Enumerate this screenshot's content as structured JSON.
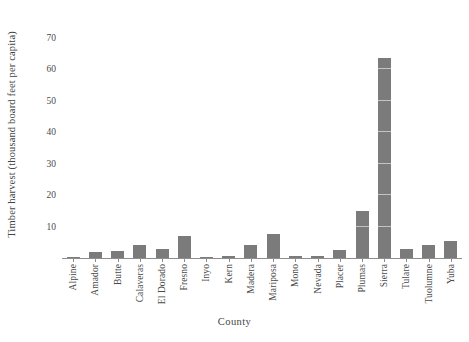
{
  "chart_data": {
    "type": "bar",
    "title": "",
    "xlabel": "County",
    "ylabel": "Timber harvest (thousand board feet per capita)",
    "categories": [
      "Alpine",
      "Amador",
      "Butte",
      "Calaveras",
      "El Dorado",
      "Fresno",
      "Inyo",
      "Kern",
      "Madera",
      "Mariposa",
      "Mono",
      "Nevada",
      "Placer",
      "Plumas",
      "Sierra",
      "Tulare",
      "Tuolumne",
      "Yuba"
    ],
    "values": [
      0.3,
      2.0,
      2.2,
      4.0,
      3.0,
      7.0,
      0.1,
      0.6,
      4.0,
      7.5,
      0.7,
      0.8,
      2.5,
      15.0,
      63.5,
      3.0,
      4.0,
      5.5
    ],
    "ytick_labels": [
      "10",
      "20",
      "30",
      "40",
      "50",
      "60",
      "70"
    ],
    "ytick_values": [
      10,
      20,
      30,
      40,
      50,
      60,
      70
    ],
    "ylim": [
      0,
      75.5
    ],
    "grid": false,
    "legend": false,
    "bar_color": "#7b7b7b",
    "axis_color": "#8e8e8e"
  }
}
